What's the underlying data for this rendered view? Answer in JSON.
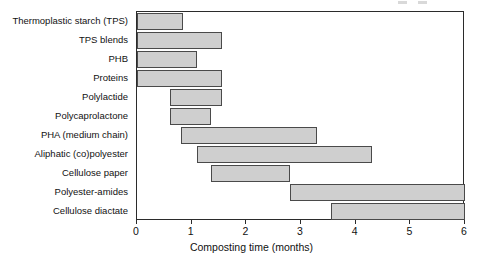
{
  "chart_data": {
    "type": "bar",
    "orientation": "horizontal",
    "title": "",
    "xlabel": "Composting time (months)",
    "ylabel": "",
    "xlim": [
      0,
      6
    ],
    "xticks": [
      0,
      1,
      2,
      3,
      4,
      5,
      6
    ],
    "xtick_labels": [
      "0",
      "1",
      "2",
      "3",
      "4",
      "5",
      "6"
    ],
    "grid": false,
    "legend": "none",
    "bar_fill_color": "#cfcfcf",
    "bar_edge_color": "#4a4a4a",
    "note": "Each bar is a floating range (start month to end month) of composting time.",
    "categories": [
      "Thermoplastic starch (TPS)",
      "TPS blends",
      "PHB",
      "Proteins",
      "Polylactide",
      "Polycaprolactone",
      "PHA (medium chain)",
      "Aliphatic (co)polyester",
      "Cellulose paper",
      "Polyester-amides",
      "Cellulose diactate"
    ],
    "ranges": [
      {
        "label": "Thermoplastic starch (TPS)",
        "start": 0.0,
        "end": 0.85
      },
      {
        "label": "TPS blends",
        "start": 0.0,
        "end": 1.55
      },
      {
        "label": "PHB",
        "start": 0.0,
        "end": 1.1
      },
      {
        "label": "Proteins",
        "start": 0.0,
        "end": 1.55
      },
      {
        "label": "Polylactide",
        "start": 0.6,
        "end": 1.55
      },
      {
        "label": "Polycaprolactone",
        "start": 0.6,
        "end": 1.35
      },
      {
        "label": "PHA (medium chain)",
        "start": 0.8,
        "end": 3.3
      },
      {
        "label": "Aliphatic (co)polyester",
        "start": 1.1,
        "end": 4.3
      },
      {
        "label": "Cellulose paper",
        "start": 1.35,
        "end": 2.8
      },
      {
        "label": "Polyester-amides",
        "start": 2.8,
        "end": 6.0
      },
      {
        "label": "Cellulose diactate",
        "start": 3.55,
        "end": 6.0
      }
    ],
    "values": [
      0.85,
      1.55,
      1.1,
      1.55,
      0.95,
      0.75,
      2.5,
      3.2,
      1.45,
      3.2,
      2.45
    ]
  }
}
